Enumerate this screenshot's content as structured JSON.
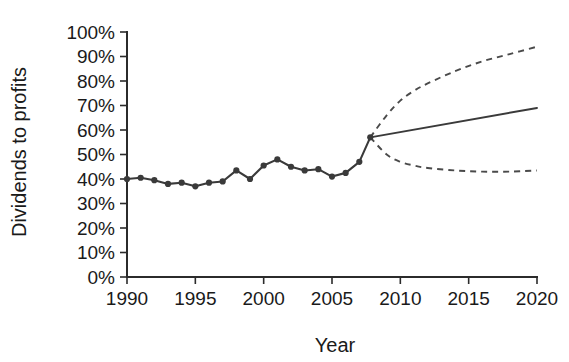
{
  "chart_data": {
    "type": "line",
    "title": "",
    "xlabel": "Year",
    "ylabel": "Dividends to profits",
    "xlim": [
      1990,
      2020
    ],
    "ylim": [
      0,
      100
    ],
    "grid": false,
    "legend": "none",
    "y_unit": "%",
    "x_ticks": [
      1990,
      1995,
      2000,
      2005,
      2010,
      2015,
      2020
    ],
    "x_tick_labels": [
      "1990",
      "1995",
      "2000",
      "2005",
      "2010",
      "2015",
      "2020"
    ],
    "y_ticks": [
      0,
      10,
      20,
      30,
      40,
      50,
      60,
      70,
      80,
      90,
      100
    ],
    "y_tick_labels": [
      "0%",
      "10%",
      "20%",
      "30%",
      "40%",
      "50%",
      "60%",
      "70%",
      "80%",
      "90%",
      "100%"
    ],
    "series": [
      {
        "name": "Historical dividends to profits",
        "style": "solid-with-markers",
        "x": [
          1990,
          1991,
          1992,
          1993,
          1994,
          1995,
          1996,
          1997,
          1998,
          1999,
          2000,
          2001,
          2002,
          2003,
          2004,
          2005,
          2006,
          2007,
          2007.8
        ],
        "values": [
          40,
          40.5,
          39.5,
          38,
          38.5,
          37,
          38.5,
          39,
          43.5,
          40,
          45.5,
          48,
          45,
          43.5,
          44,
          41,
          42.5,
          47,
          57
        ]
      },
      {
        "name": "Central projection",
        "style": "solid",
        "x": [
          2007.8,
          2020
        ],
        "values": [
          57,
          69
        ]
      },
      {
        "name": "Upper projection",
        "style": "dashed",
        "x": [
          2007.8,
          2009,
          2010,
          2011,
          2012,
          2014,
          2016,
          2018,
          2020
        ],
        "values": [
          57,
          66,
          72,
          76,
          79,
          84,
          88,
          91,
          94
        ]
      },
      {
        "name": "Lower projection",
        "style": "dashed",
        "x": [
          2007.8,
          2009,
          2010,
          2011,
          2012,
          2014,
          2016,
          2018,
          2020
        ],
        "values": [
          57,
          50,
          47,
          45.5,
          44.5,
          43.5,
          43,
          43,
          43.5
        ]
      }
    ]
  }
}
